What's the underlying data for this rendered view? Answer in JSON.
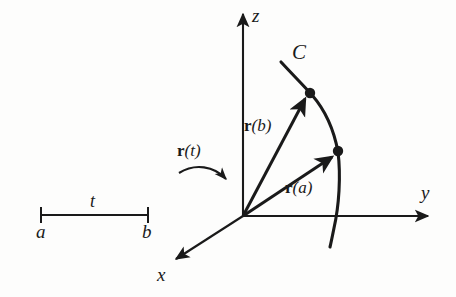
{
  "figure": {
    "background_color": "#fdfdfc",
    "ink_color": "#1a1a1a"
  },
  "axes": {
    "z": {
      "label": "z",
      "icon": "axis-arrow-up"
    },
    "y": {
      "label": "y",
      "icon": "axis-arrow-right"
    },
    "x": {
      "label": "x",
      "icon": "axis-arrow-down-left"
    }
  },
  "curve": {
    "label": "C"
  },
  "interval": {
    "label": "t",
    "start_label": "a",
    "end_label": "b"
  },
  "mapping": {
    "name": "r",
    "arg": "(t)",
    "icon": "curved-arrow-right"
  },
  "vectors": [
    {
      "name": "r",
      "arg": "(b)",
      "target": "curve-point-b"
    },
    {
      "name": "r",
      "arg": "(a)",
      "target": "curve-point-a"
    }
  ],
  "points": [
    {
      "name": "curve-point-b"
    },
    {
      "name": "curve-point-a"
    }
  ]
}
